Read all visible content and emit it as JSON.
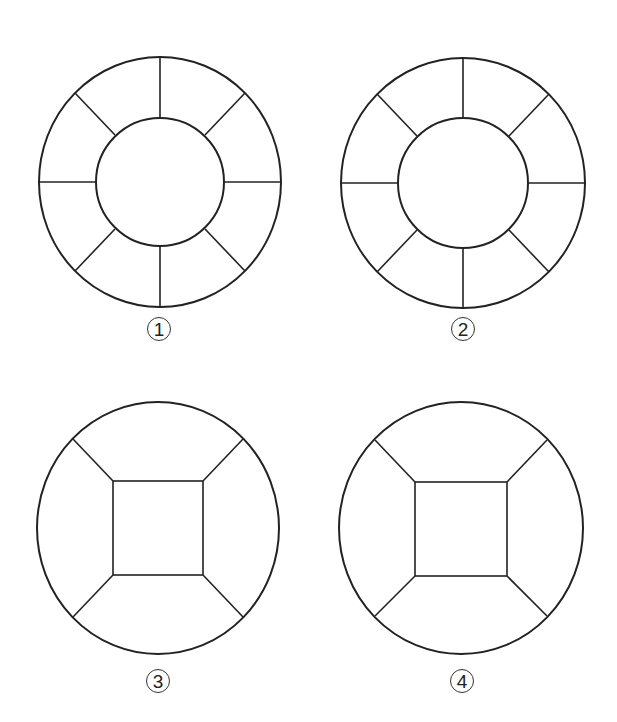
{
  "stroke_color": "#222222",
  "figures": [
    {
      "id": 1,
      "label": "1",
      "type": "ring-8-segments",
      "outer": {
        "cx": 160,
        "cy": 182,
        "rx": 121,
        "ry": 125
      },
      "inner": {
        "cx": 160,
        "cy": 182,
        "r": 64
      },
      "spokes": 8,
      "label_pos": {
        "x": 147,
        "y": 317
      }
    },
    {
      "id": 2,
      "label": "2",
      "type": "ring-8-segments",
      "outer": {
        "cx": 463,
        "cy": 183,
        "rx": 122,
        "ry": 125
      },
      "inner": {
        "cx": 463,
        "cy": 183,
        "r": 65
      },
      "spokes": 8,
      "label_pos": {
        "x": 451,
        "y": 317
      }
    },
    {
      "id": 3,
      "label": "3",
      "type": "circle-square-4-segments",
      "outer": {
        "cx": 158,
        "cy": 528,
        "rx": 121,
        "ry": 126
      },
      "square": {
        "x": 113,
        "y": 481,
        "w": 90,
        "h": 94
      },
      "label_pos": {
        "x": 146,
        "y": 669
      }
    },
    {
      "id": 4,
      "label": "4",
      "type": "circle-square-4-segments",
      "outer": {
        "cx": 461,
        "cy": 528,
        "rx": 122,
        "ry": 126
      },
      "square": {
        "x": 415,
        "y": 482,
        "w": 92,
        "h": 94
      },
      "label_pos": {
        "x": 450,
        "y": 669
      }
    }
  ]
}
